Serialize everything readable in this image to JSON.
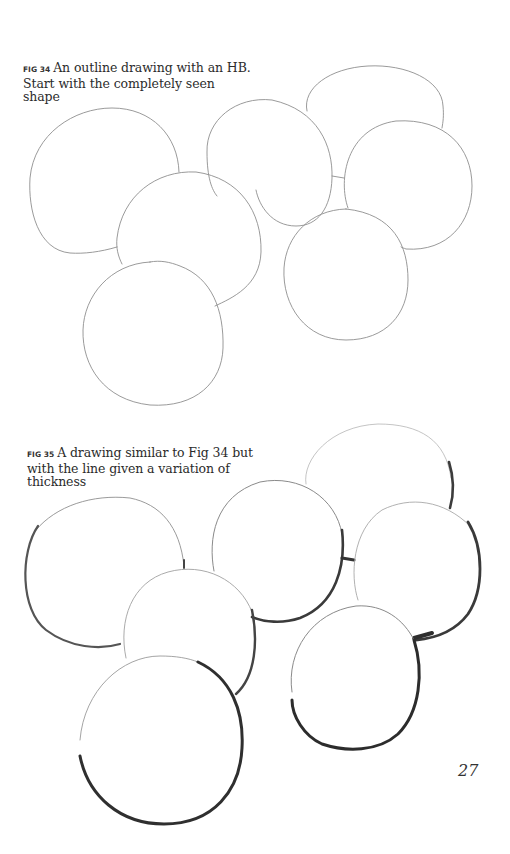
{
  "page": {
    "page_number": "27",
    "background": "#ffffff"
  },
  "figures": [
    {
      "label": "FIG 34",
      "caption": "An outline drawing with an HB. Start with the completely seen shape",
      "stroke_color": "#8a8a8a",
      "style": "thin uniform outline"
    },
    {
      "label": "FIG 35",
      "caption": "A drawing similar to Fig 34 but with the line given a variation of thickness",
      "stroke_color": "#3a3a3a",
      "style": "variable-thickness outline"
    }
  ]
}
